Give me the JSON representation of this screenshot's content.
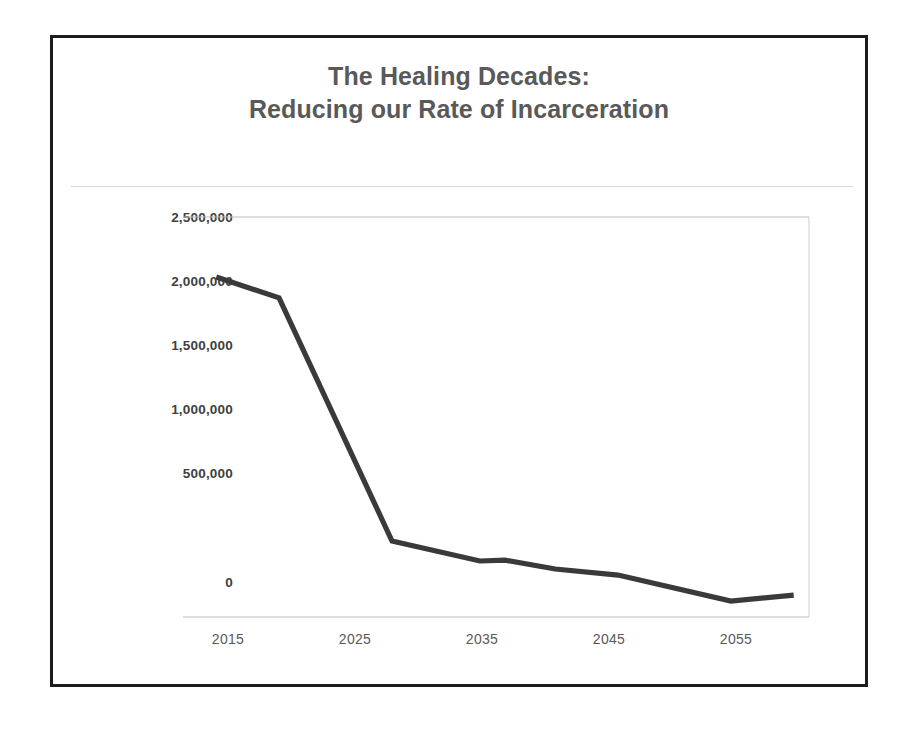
{
  "page": {
    "background_color": "#ffffff",
    "frame_border_color": "#1c1c1c"
  },
  "chart_data": {
    "type": "line",
    "title": "The Healing Decades: Reducing our Rate of Incarceration",
    "title_lines": [
      "The Healing Decades:",
      "Reducing our Rate of Incarceration"
    ],
    "xlabel": "",
    "ylabel": "",
    "xlim": [
      2013.5,
      2060.5
    ],
    "ylim": [
      0,
      2500000
    ],
    "x_ticks": [
      2015,
      2025,
      2035,
      2045,
      2055
    ],
    "x_tick_labels": [
      "2015",
      "2025",
      "2035",
      "2045",
      "2055"
    ],
    "y_ticks": [
      0,
      500000,
      1000000,
      1500000,
      2000000,
      2500000
    ],
    "y_tick_labels": [
      "0",
      "500,000",
      "1,000,000",
      "1,500,000",
      "2,000,000",
      "2,500,000"
    ],
    "grid": false,
    "legend": false,
    "legend_position": "none",
    "series": [
      {
        "name": "Rate of Incarceration",
        "color": "#3a3a3a",
        "line_width": 5,
        "x": [
          2014,
          2019,
          2028,
          2035,
          2037,
          2041,
          2046,
          2055,
          2060
        ],
        "values": [
          2125000,
          1995000,
          475000,
          350000,
          355000,
          300000,
          262000,
          100000,
          137000
        ]
      }
    ],
    "annotations": []
  },
  "axis": {
    "baseline_color": "#bdbdbd",
    "plot_border_color": "#cfcfcf",
    "tick_label_color_y": "#3f3f3f",
    "tick_label_color_x": "#595959",
    "title_color": "#595959"
  },
  "decor": {
    "title_rule_color": "#d8d8d8"
  }
}
